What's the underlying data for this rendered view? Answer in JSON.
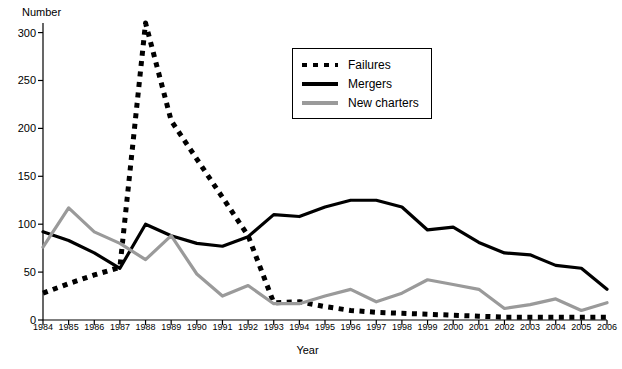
{
  "chart_data": {
    "type": "line",
    "title": "",
    "xlabel": "Year",
    "ylabel": "Number",
    "x": [
      1984,
      1985,
      1986,
      1987,
      1988,
      1989,
      1990,
      1991,
      1992,
      1993,
      1994,
      1995,
      1996,
      1997,
      1998,
      1999,
      2000,
      2001,
      2002,
      2003,
      2004,
      2005,
      2006
    ],
    "categories": [
      "1984",
      "1985",
      "1986",
      "1987",
      "1988",
      "1989",
      "1990",
      "1991",
      "1992",
      "1993",
      "1994",
      "1995",
      "1996",
      "1997",
      "1998",
      "1999",
      "2000",
      "2001",
      "2002",
      "2003",
      "2004",
      "2005",
      "2006"
    ],
    "xlim": [
      1984,
      2006
    ],
    "ylim": [
      0,
      310
    ],
    "yticks": [
      0,
      50,
      100,
      150,
      200,
      250,
      300
    ],
    "ytick_labels": [
      "0",
      "50",
      "100",
      "150",
      "200",
      "250",
      "300"
    ],
    "grid": false,
    "legend_position": "upper-center",
    "series": [
      {
        "name": "Failures",
        "style": "dotted",
        "color": "#000000",
        "values": [
          28,
          38,
          47,
          55,
          310,
          208,
          168,
          128,
          88,
          18,
          19,
          14,
          10,
          8,
          7,
          6,
          5,
          4,
          3,
          3,
          3,
          3,
          3
        ]
      },
      {
        "name": "Mergers",
        "style": "solid",
        "color": "#000000",
        "values": [
          92,
          83,
          70,
          54,
          100,
          88,
          80,
          77,
          87,
          110,
          108,
          118,
          125,
          125,
          118,
          94,
          97,
          81,
          70,
          68,
          57,
          54,
          32
        ]
      },
      {
        "name": "New charters",
        "style": "solid",
        "color": "#9a9a9a",
        "values": [
          76,
          117,
          92,
          80,
          63,
          88,
          48,
          25,
          36,
          17,
          17,
          25,
          32,
          19,
          28,
          42,
          37,
          32,
          12,
          16,
          22,
          10,
          18
        ]
      }
    ]
  },
  "legend": {
    "entries": [
      {
        "label": "Failures",
        "swatch": "dotted-line-swatch"
      },
      {
        "label": "Mergers",
        "swatch": "solid-black-line-swatch"
      },
      {
        "label": "New charters",
        "swatch": "solid-gray-line-swatch"
      }
    ]
  },
  "colors": {
    "axis": "#000000",
    "failures": "#000000",
    "mergers": "#000000",
    "new_charters": "#9a9a9a",
    "background": "#ffffff"
  }
}
